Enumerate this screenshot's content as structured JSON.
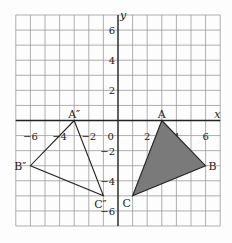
{
  "diagram": {
    "axes": {
      "x_label": "x",
      "y_label": "y",
      "x_range": [
        -7,
        7
      ],
      "y_range": [
        -7,
        7
      ],
      "origin_label": "0"
    },
    "x_ticks": [
      {
        "v": -6,
        "label": "−6"
      },
      {
        "v": -4,
        "label": "−4"
      },
      {
        "v": -2,
        "label": "−2"
      },
      {
        "v": 2,
        "label": "2"
      },
      {
        "v": 4,
        "label": "4"
      },
      {
        "v": 6,
        "label": "6"
      }
    ],
    "y_ticks": [
      {
        "v": 6,
        "label": "6"
      },
      {
        "v": 4,
        "label": "4"
      },
      {
        "v": 2,
        "label": "2"
      },
      {
        "v": -2,
        "label": "−2"
      },
      {
        "v": -4,
        "label": "−4"
      },
      {
        "v": -6,
        "label": "−6"
      }
    ],
    "triangle_original": {
      "fill": "#7a7a7a",
      "vertices": [
        {
          "name": "A",
          "x": 3,
          "y": 0
        },
        {
          "name": "B",
          "x": 6,
          "y": -3
        },
        {
          "name": "C",
          "x": 1,
          "y": -5
        }
      ]
    },
    "triangle_image": {
      "fill": "none",
      "vertices": [
        {
          "name": "A″",
          "x": -3,
          "y": 0
        },
        {
          "name": "B″",
          "x": -6,
          "y": -3
        },
        {
          "name": "C″",
          "x": -1,
          "y": -5
        }
      ]
    }
  }
}
